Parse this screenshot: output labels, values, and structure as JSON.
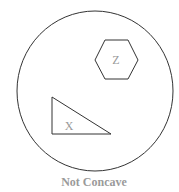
{
  "diagram": {
    "container": {
      "shape": "circle",
      "stroke": "#333333"
    },
    "shapes": [
      {
        "name": "hexagon",
        "label": "Z"
      },
      {
        "name": "triangle",
        "label": "X"
      }
    ],
    "caption": "Not Concave",
    "colors": {
      "line": "#333333",
      "label_text": "#9a9a9a",
      "background": "#ffffff"
    }
  }
}
